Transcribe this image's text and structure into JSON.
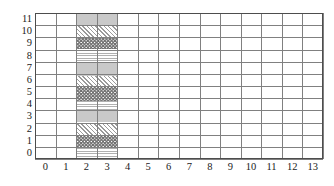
{
  "figure": {
    "title": "",
    "background_color": "#ffffff",
    "grid_line_color": "#808080",
    "axis_line_color": "#4d4d4d",
    "label_color": "#1a1a1a"
  },
  "chart_data": {
    "type": "heatmap",
    "title": "",
    "xlabel": "",
    "ylabel": "",
    "xlim": [
      -0.5,
      13.5
    ],
    "ylim": [
      -0.5,
      11.5
    ],
    "grid": true,
    "legend": "none",
    "x_ticks": [
      0,
      1,
      2,
      3,
      4,
      5,
      6,
      7,
      8,
      9,
      10,
      11,
      12,
      13
    ],
    "x_tick_labels": [
      "0",
      "1",
      "2",
      "3",
      "4",
      "5",
      "6",
      "7",
      "8",
      "9",
      "10",
      "11",
      "12",
      "13"
    ],
    "y_ticks": [
      0,
      1,
      2,
      3,
      4,
      5,
      6,
      7,
      8,
      9,
      10,
      11
    ],
    "y_tick_labels": [
      "0",
      "1",
      "2",
      "3",
      "4",
      "5",
      "6",
      "7",
      "8",
      "9",
      "10",
      "11"
    ],
    "cell_size": 1,
    "grid_columns": 14,
    "grid_rows": 12,
    "filled_region": {
      "x_start": 1.5,
      "x_end": 3.5,
      "y_start": -0.5,
      "y_end": 11.5,
      "width_in_cells": 2,
      "description": "vertical textured column spanning columns 2 and 3"
    },
    "bands": [
      {
        "index": 0,
        "pattern": "solid-gray",
        "y_start": 10.5,
        "y_end": 11.5,
        "color": "#c9c9c9"
      },
      {
        "index": 1,
        "pattern": "diagonal-hatch",
        "y_start": 9.5,
        "y_end": 10.5,
        "color": "#9a9a9a"
      },
      {
        "index": 2,
        "pattern": "checkerboard",
        "y_start": 8.5,
        "y_end": 9.5,
        "color": "#6e6e6e"
      },
      {
        "index": 3,
        "pattern": "horizontal-lines",
        "y_start": 7.5,
        "y_end": 8.5,
        "color": "#b0b0b0"
      },
      {
        "index": 4,
        "pattern": "solid-gray",
        "y_start": 6.3,
        "y_end": 7.5,
        "color": "#c9c9c9"
      },
      {
        "index": 5,
        "pattern": "diagonal-hatch",
        "y_start": 5.4,
        "y_end": 6.3,
        "color": "#9a9a9a"
      },
      {
        "index": 6,
        "pattern": "checkerboard",
        "y_start": 4.3,
        "y_end": 5.4,
        "color": "#6e6e6e"
      },
      {
        "index": 7,
        "pattern": "horizontal-lines",
        "y_start": 3.5,
        "y_end": 4.3,
        "color": "#b0b0b0"
      },
      {
        "index": 8,
        "pattern": "solid-gray",
        "y_start": 2.5,
        "y_end": 3.5,
        "color": "#c9c9c9"
      },
      {
        "index": 9,
        "pattern": "diagonal-hatch",
        "y_start": 1.4,
        "y_end": 2.5,
        "color": "#9a9a9a"
      },
      {
        "index": 10,
        "pattern": "checkerboard",
        "y_start": 0.4,
        "y_end": 1.4,
        "color": "#6e6e6e"
      },
      {
        "index": 11,
        "pattern": "horizontal-lines",
        "y_start": -0.5,
        "y_end": 0.4,
        "color": "#b0b0b0"
      }
    ]
  }
}
